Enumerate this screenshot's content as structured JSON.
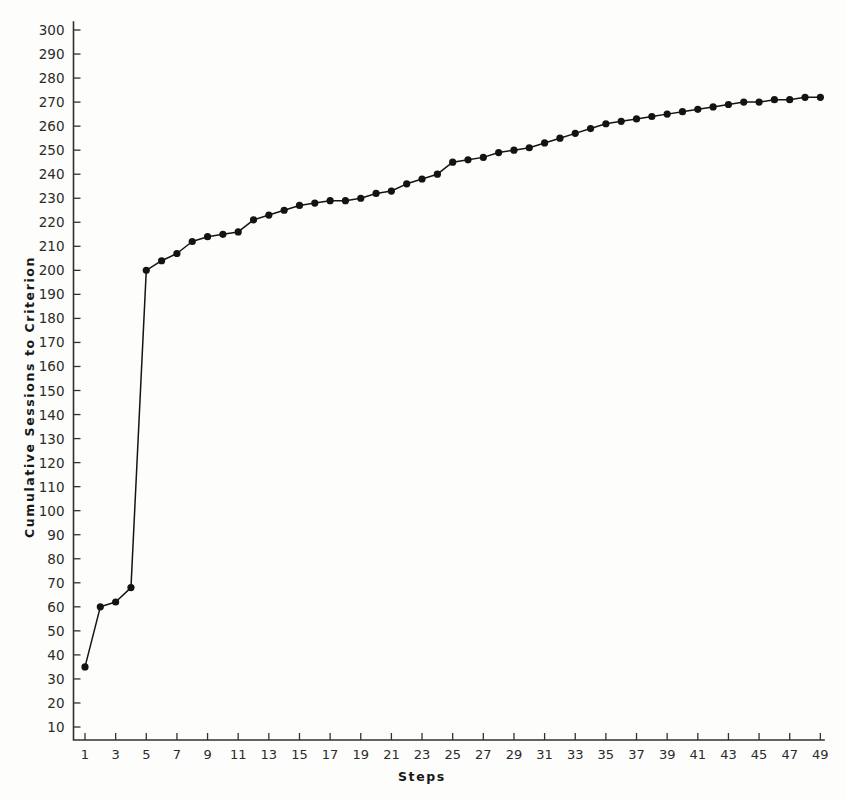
{
  "chart_data": {
    "type": "line",
    "title": "",
    "xlabel": "Steps",
    "ylabel": "Cumulative Sessions to Criterion",
    "xlim": [
      0,
      50
    ],
    "ylim": [
      10,
      300
    ],
    "grid": false,
    "legend": null,
    "marker": "filled-circle",
    "x": [
      1,
      2,
      3,
      4,
      5,
      6,
      7,
      8,
      9,
      10,
      11,
      12,
      13,
      14,
      15,
      16,
      17,
      18,
      19,
      20,
      21,
      22,
      23,
      24,
      25,
      26,
      27,
      28,
      29,
      30,
      31,
      32,
      33,
      34,
      35,
      36,
      37,
      38,
      39,
      40,
      41,
      42,
      43,
      44,
      45,
      46,
      47,
      48,
      49
    ],
    "values": [
      35,
      60,
      62,
      68,
      200,
      204,
      207,
      212,
      214,
      215,
      216,
      221,
      223,
      225,
      227,
      228,
      229,
      229,
      230,
      232,
      233,
      236,
      238,
      240,
      245,
      246,
      247,
      249,
      250,
      251,
      253,
      255,
      257,
      259,
      261,
      262,
      263,
      264,
      265,
      266,
      267,
      268,
      269,
      270,
      270,
      271,
      271,
      272,
      272
    ],
    "x_tick_labels": [
      "1",
      "3",
      "5",
      "7",
      "9",
      "11",
      "13",
      "15",
      "17",
      "19",
      "21",
      "23",
      "25",
      "27",
      "29",
      "31",
      "33",
      "35",
      "37",
      "39",
      "41",
      "43",
      "45",
      "47",
      "49"
    ],
    "x_tick_values": [
      1,
      3,
      5,
      7,
      9,
      11,
      13,
      15,
      17,
      19,
      21,
      23,
      25,
      27,
      29,
      31,
      33,
      35,
      37,
      39,
      41,
      43,
      45,
      47,
      49
    ],
    "y_tick_labels": [
      "10",
      "20",
      "30",
      "40",
      "50",
      "60",
      "70",
      "80",
      "90",
      "100",
      "110",
      "120",
      "130",
      "140",
      "150",
      "160",
      "170",
      "180",
      "190",
      "200",
      "210",
      "220",
      "230",
      "240",
      "250",
      "260",
      "270",
      "280",
      "290",
      "300"
    ],
    "y_tick_values": [
      10,
      20,
      30,
      40,
      50,
      60,
      70,
      80,
      90,
      100,
      110,
      120,
      130,
      140,
      150,
      160,
      170,
      180,
      190,
      200,
      210,
      220,
      230,
      240,
      250,
      260,
      270,
      280,
      290,
      300
    ],
    "colors": {
      "line": "#141414",
      "marker": "#131313",
      "axis": "#33312f",
      "text": "#2b2b2b",
      "background": "#fdfdfc"
    }
  }
}
